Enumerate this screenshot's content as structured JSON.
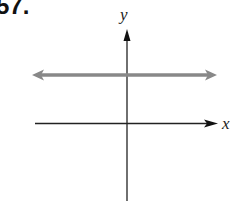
{
  "problem": {
    "number": "57."
  },
  "axes": {
    "x_label": "x",
    "y_label": "y",
    "axis_color": "#222222"
  },
  "graph": {
    "description": "Horizontal line above the x-axis with arrows on both ends",
    "line_color": "#888888"
  }
}
